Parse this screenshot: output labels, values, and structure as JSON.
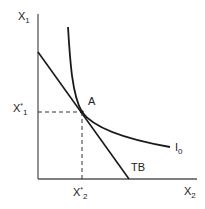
{
  "diagram": {
    "type": "indifference-curve-budget-line",
    "colors": {
      "line": "#1a1a1a",
      "axis": "#555555",
      "dashed": "#333333"
    },
    "axes": {
      "y_label": {
        "base": "X",
        "sub": "1"
      },
      "x_label": {
        "base": "X",
        "sub": "2"
      }
    },
    "curves": {
      "indifference": {
        "base": "I",
        "sub": "0"
      },
      "budget": {
        "label": "TB"
      }
    },
    "point": {
      "label": "A"
    },
    "equilibrium": {
      "x1_star": {
        "base": "X",
        "sup": "*",
        "sub": "1"
      },
      "x2_star": {
        "base": "X",
        "sup": "*",
        "sub": "2"
      }
    }
  }
}
